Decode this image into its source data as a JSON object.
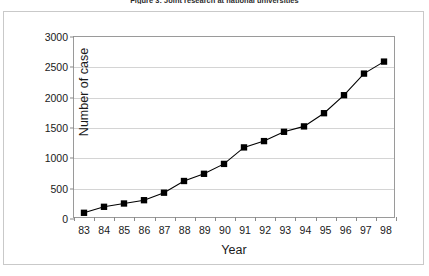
{
  "figure": {
    "caption": "Figure 3: Joint research at national universities"
  },
  "chart_data": {
    "type": "line",
    "title": "Figure 3: Joint research at national universities",
    "xlabel": "Year",
    "ylabel": "Number of case",
    "categories": [
      "83",
      "84",
      "85",
      "86",
      "87",
      "88",
      "89",
      "90",
      "91",
      "92",
      "93",
      "94",
      "95",
      "96",
      "97",
      "98"
    ],
    "values": [
      70,
      170,
      225,
      280,
      405,
      600,
      720,
      885,
      1160,
      1265,
      1420,
      1510,
      1730,
      2030,
      2390,
      2590
    ],
    "ylim": [
      0,
      3000
    ],
    "yticks": [
      0,
      500,
      1000,
      1500,
      2000,
      2500,
      3000
    ],
    "ytick_labels": [
      "0",
      "500",
      "1000",
      "1500",
      "2000",
      "2500",
      "3000"
    ],
    "grid": true,
    "legend": false,
    "series": [
      {
        "name": "Number of case",
        "marker": "square",
        "marker_color": "#000000",
        "line_color": "#000000",
        "values": [
          70,
          170,
          225,
          280,
          405,
          600,
          720,
          885,
          1160,
          1265,
          1420,
          1510,
          1730,
          2030,
          2390,
          2590
        ]
      }
    ]
  },
  "colors": {
    "line": "#000000",
    "marker": "#000000",
    "grid": "#d4d4d4",
    "axis": "#9a9a9a",
    "frame": "#c9c9c9",
    "text": "#1a1a1a"
  }
}
